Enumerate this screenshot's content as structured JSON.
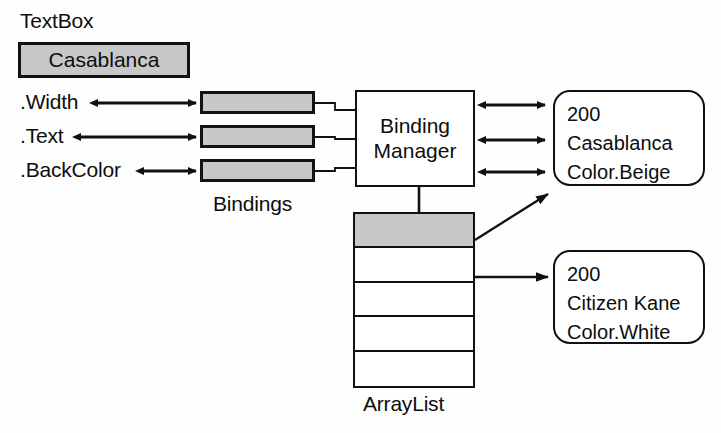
{
  "diagram": {
    "colors": {
      "fill_shaded": "#c8c8c8",
      "stroke": "#111111",
      "background": "#ffffff"
    }
  },
  "textbox": {
    "caption": "TextBox",
    "value": "Casablanca"
  },
  "properties": [
    {
      "label": ".Width"
    },
    {
      "label": ".Text"
    },
    {
      "label": ".BackColor"
    }
  ],
  "bindings": {
    "caption": "Bindings",
    "items": [
      {
        "name": "width-binding"
      },
      {
        "name": "text-binding"
      },
      {
        "name": "backcolor-binding"
      }
    ]
  },
  "binding_manager": {
    "lines": [
      "Binding",
      "Manager"
    ]
  },
  "arraylist": {
    "caption": "ArrayList",
    "cells": [
      {
        "selected": true
      },
      {
        "selected": false
      },
      {
        "selected": false
      },
      {
        "selected": false
      },
      {
        "selected": false
      }
    ]
  },
  "value_boxes": [
    {
      "name": "current-item-values",
      "lines": [
        "200",
        "Casablanca",
        "Color.Beige"
      ]
    },
    {
      "name": "next-item-values",
      "lines": [
        "200",
        "Citizen Kane",
        "Color.White"
      ]
    }
  ]
}
